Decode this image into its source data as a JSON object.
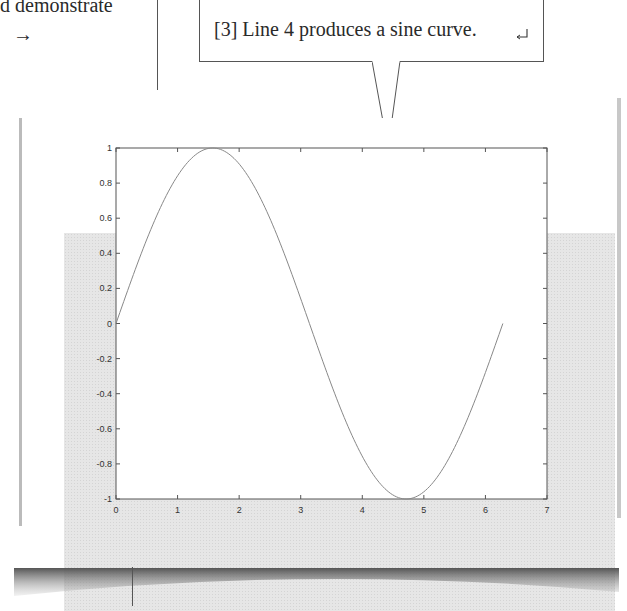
{
  "document": {
    "body_text_fragment": "d demonstrate",
    "arrow_glyph": "→"
  },
  "callout": {
    "text": "[3] Line 4 produces a sine curve.",
    "return_glyph": "↵"
  },
  "colors": {
    "panel_background": "#e6e6e6",
    "axes_background": "#ffffff",
    "line_color": "#888888",
    "axis_color": "#555555"
  },
  "chart_data": {
    "type": "line",
    "title": "",
    "xlabel": "",
    "ylabel": "",
    "xlim": [
      0,
      7
    ],
    "ylim": [
      -1,
      1
    ],
    "grid": false,
    "legend": null,
    "x_ticks": [
      0,
      1,
      2,
      3,
      4,
      5,
      6,
      7
    ],
    "x_tick_labels": [
      "0",
      "1",
      "2",
      "3",
      "4",
      "5",
      "6",
      "7"
    ],
    "y_ticks": [
      1,
      0.8,
      0.6,
      0.4,
      0.2,
      0,
      -0.2,
      -0.4,
      -0.6,
      -0.8,
      -1
    ],
    "y_tick_labels": [
      "1",
      "0.8",
      "0.6",
      "0.4",
      "0.2",
      "0",
      "-0.2",
      "-0.4",
      "-0.6",
      "-0.8",
      "-1"
    ],
    "series": [
      {
        "name": "sin(x)",
        "function": "sin",
        "x_range": [
          0,
          6.2832
        ],
        "x": [
          0,
          0.5,
          1.0,
          1.5708,
          2.0,
          2.5,
          3.1416,
          3.5,
          4.0,
          4.7124,
          5.0,
          5.5,
          6.2832
        ],
        "y": [
          0,
          0.479,
          0.841,
          1.0,
          0.909,
          0.598,
          0,
          -0.351,
          -0.757,
          -1.0,
          -0.959,
          -0.706,
          0
        ]
      }
    ]
  }
}
